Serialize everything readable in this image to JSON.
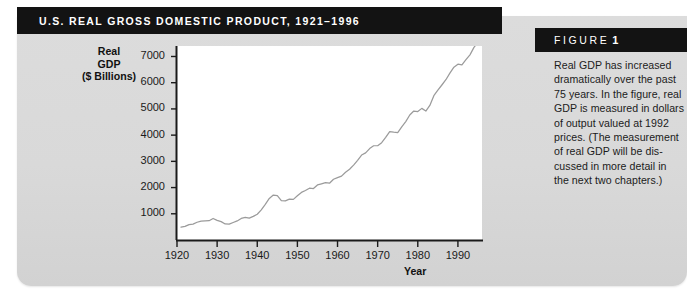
{
  "figure": {
    "title": "U.S. Real Gross Domestic Product, 1921–1996",
    "label_word": "FIGURE",
    "number": "1",
    "caption_lines": [
      "Real GDP has increased",
      "dramatically over the past",
      "75 years. In the figure, real",
      "GDP is measured in dollars",
      "of output valued at 1992",
      "prices. (The measurement",
      "of real GDP will be dis-",
      "cussed in more detail in",
      "the next two chapters.)"
    ]
  },
  "colors": {
    "panel": "#d9d9d9",
    "bar": "#131313",
    "plot_bg": "#ffffff",
    "line": "#9b9b9b",
    "axis": "#1a1a1a",
    "text": "#1b1b1b"
  },
  "chart_data": {
    "type": "line",
    "title": "U.S. Real Gross Domestic Product, 1921–1996",
    "xlabel": "Year",
    "ylabel": "Real GDP ($ Billions)",
    "ylabel_lines": [
      "Real",
      "GDP",
      "($ Billions)"
    ],
    "grid": false,
    "legend": false,
    "xlim": [
      1920,
      1996
    ],
    "ylim": [
      0,
      7400
    ],
    "xticks": [
      1920,
      1930,
      1940,
      1950,
      1960,
      1970,
      1980,
      1990
    ],
    "yticks": [
      1000,
      2000,
      3000,
      4000,
      5000,
      6000,
      7000
    ],
    "series": [
      {
        "name": "Real GDP (1992 dollars)",
        "x": [
          1921,
          1922,
          1923,
          1924,
          1925,
          1926,
          1927,
          1928,
          1929,
          1930,
          1931,
          1932,
          1933,
          1934,
          1935,
          1936,
          1937,
          1938,
          1939,
          1940,
          1941,
          1942,
          1943,
          1944,
          1945,
          1946,
          1947,
          1948,
          1949,
          1950,
          1951,
          1952,
          1953,
          1954,
          1955,
          1956,
          1957,
          1958,
          1959,
          1960,
          1961,
          1962,
          1963,
          1964,
          1965,
          1966,
          1967,
          1968,
          1969,
          1970,
          1971,
          1972,
          1973,
          1974,
          1975,
          1976,
          1977,
          1978,
          1979,
          1980,
          1981,
          1982,
          1983,
          1984,
          1985,
          1986,
          1987,
          1988,
          1989,
          1990,
          1991,
          1992,
          1993,
          1994,
          1995,
          1996
        ],
        "values": [
          490,
          518,
          586,
          604,
          677,
          722,
          729,
          737,
          822,
          751,
          702,
          611,
          603,
          668,
          728,
          822,
          866,
          835,
          903,
          981,
          1150,
          1360,
          1584,
          1714,
          1693,
          1505,
          1495,
          1560,
          1550,
          1687,
          1815,
          1887,
          1975,
          1962,
          2100,
          2144,
          2185,
          2165,
          2316,
          2377,
          2436,
          2586,
          2700,
          2857,
          3041,
          3240,
          3324,
          3486,
          3595,
          3598,
          3714,
          3913,
          4134,
          4112,
          4096,
          4317,
          4517,
          4767,
          4919,
          4901,
          5021,
          4919,
          5132,
          5505,
          5717,
          5912,
          6113,
          6368,
          6592,
          6708,
          6676,
          6880,
          7063,
          7348,
          7544,
          7813
        ]
      }
    ],
    "annotations": []
  }
}
